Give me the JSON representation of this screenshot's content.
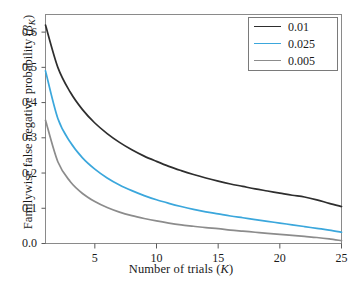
{
  "chart_data": {
    "type": "line",
    "title": "",
    "xlabel": "Number of trials (K)",
    "ylabel": "Familywise false negative probability (βK)",
    "ylabel_parts": {
      "prefix": "Familywise false negative probability (",
      "symbol": "β",
      "subscript": "K",
      "suffix": ")"
    },
    "xlabel_parts": {
      "prefix": "Number of trials (",
      "symbol": "K",
      "suffix": ")"
    },
    "xlim": [
      1,
      25
    ],
    "ylim": [
      0.0,
      0.65
    ],
    "xticks": [
      5,
      10,
      15,
      20,
      25
    ],
    "xtick_labels": [
      "5",
      "10",
      "15",
      "20",
      "25"
    ],
    "yticks": [
      0.0,
      0.1,
      0.2,
      0.3,
      0.4,
      0.5,
      0.6
    ],
    "ytick_labels": [
      "0.0",
      "0.1",
      "0.2",
      "0.3",
      "0.4",
      "0.5",
      "0.6"
    ],
    "grid": false,
    "legend_position": "top-right",
    "x": [
      1,
      2,
      3,
      4,
      5,
      6,
      7,
      8,
      9,
      10,
      11,
      12,
      13,
      14,
      15,
      16,
      17,
      18,
      19,
      20,
      21,
      22,
      23,
      24,
      25
    ],
    "series": [
      {
        "name": "0.01",
        "color": "#2e2e2e",
        "values": [
          0.62,
          0.5,
          0.43,
          0.38,
          0.342,
          0.312,
          0.287,
          0.266,
          0.248,
          0.233,
          0.219,
          0.207,
          0.196,
          0.186,
          0.177,
          0.169,
          0.162,
          0.155,
          0.149,
          0.143,
          0.137,
          0.132,
          0.124,
          0.114,
          0.105
        ]
      },
      {
        "name": "0.025",
        "color": "#3ba7dc",
        "values": [
          0.49,
          0.355,
          0.288,
          0.243,
          0.211,
          0.186,
          0.166,
          0.15,
          0.136,
          0.124,
          0.114,
          0.105,
          0.097,
          0.09,
          0.084,
          0.078,
          0.073,
          0.068,
          0.063,
          0.058,
          0.053,
          0.048,
          0.043,
          0.038,
          0.032
        ]
      },
      {
        "name": "0.005",
        "color": "#8c8c8c",
        "values": [
          0.35,
          0.232,
          0.176,
          0.142,
          0.119,
          0.102,
          0.089,
          0.079,
          0.071,
          0.064,
          0.058,
          0.053,
          0.049,
          0.045,
          0.042,
          0.038,
          0.035,
          0.032,
          0.029,
          0.026,
          0.023,
          0.02,
          0.017,
          0.013,
          0.008
        ]
      }
    ]
  },
  "legend": {
    "entries": [
      {
        "label": "0.01",
        "color": "#2e2e2e"
      },
      {
        "label": "0.025",
        "color": "#3ba7dc"
      },
      {
        "label": "0.005",
        "color": "#8c8c8c"
      }
    ]
  },
  "colors": {
    "frame": "#8a8a8a",
    "text": "#1a1a1a",
    "background": "#ffffff"
  }
}
